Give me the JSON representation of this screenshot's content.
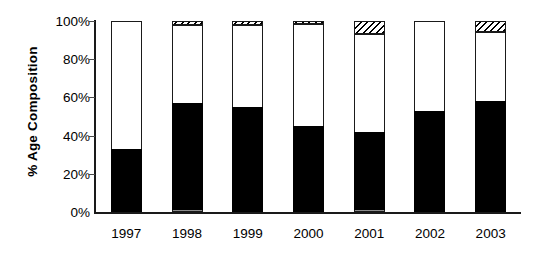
{
  "chart_data": {
    "type": "bar",
    "subtype": "stacked-percentage-column",
    "title": "",
    "xlabel": "",
    "ylabel": "% Age Composition",
    "ylim": [
      0,
      100
    ],
    "ytick_labels": [
      "0%",
      "20%",
      "40%",
      "60%",
      "80%",
      "100%"
    ],
    "ytick_values": [
      0,
      20,
      40,
      60,
      80,
      100
    ],
    "grid": false,
    "legend": "none",
    "categories": [
      "1997",
      "1998",
      "1999",
      "2000",
      "2001",
      "2002",
      "2003"
    ],
    "series": [
      {
        "name": "gray-segment",
        "fill": "solid-gray",
        "color": "#8c8c8c",
        "values": [
          0,
          1,
          0,
          0,
          1,
          0,
          0
        ]
      },
      {
        "name": "black-segment",
        "fill": "solid-black",
        "color": "#000000",
        "values": [
          33,
          56,
          55,
          45,
          41,
          53,
          58
        ]
      },
      {
        "name": "white-segment",
        "fill": "solid-white",
        "color": "#ffffff",
        "values": [
          67,
          41,
          43,
          53.5,
          51,
          47,
          36
        ]
      },
      {
        "name": "hatched-segment",
        "fill": "diagonal-hatch",
        "color": "#000000",
        "values": [
          0,
          2,
          2,
          1.5,
          7,
          0,
          6
        ]
      }
    ]
  },
  "axes": {
    "y_title": "% Age Composition"
  }
}
